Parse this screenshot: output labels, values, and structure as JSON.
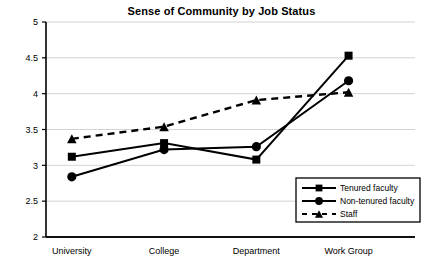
{
  "chart_data": {
    "type": "line",
    "title": "Sense of Community by Job Status",
    "xlabel": "",
    "ylabel": "",
    "categories": [
      "University",
      "College",
      "Department",
      "Work Group"
    ],
    "ylim": [
      2,
      5
    ],
    "ytick_labels": [
      "5",
      "4.5",
      "4",
      "3.5",
      "3",
      "2.5",
      "2"
    ],
    "ytick_values": [
      5,
      4.5,
      4,
      3.5,
      3,
      2.5,
      2
    ],
    "grid": true,
    "legend_position": "bottom-right",
    "series": [
      {
        "name": "Tenured faculty",
        "values": [
          3.12,
          3.31,
          3.08,
          4.53
        ],
        "marker": "square",
        "line_style": "solid",
        "color": "#000000"
      },
      {
        "name": "Non-tenured faculty",
        "values": [
          2.84,
          3.22,
          3.26,
          4.18
        ],
        "marker": "circle",
        "line_style": "solid",
        "color": "#000000"
      },
      {
        "name": "Staff",
        "values": [
          3.37,
          3.54,
          3.91,
          4.02
        ],
        "marker": "triangle",
        "line_style": "dashed",
        "color": "#000000"
      }
    ]
  },
  "colors": {
    "axis": "#000000",
    "grid": "#c8c8c8",
    "plot_background": "#ffffff",
    "legend_border": "#000000"
  }
}
